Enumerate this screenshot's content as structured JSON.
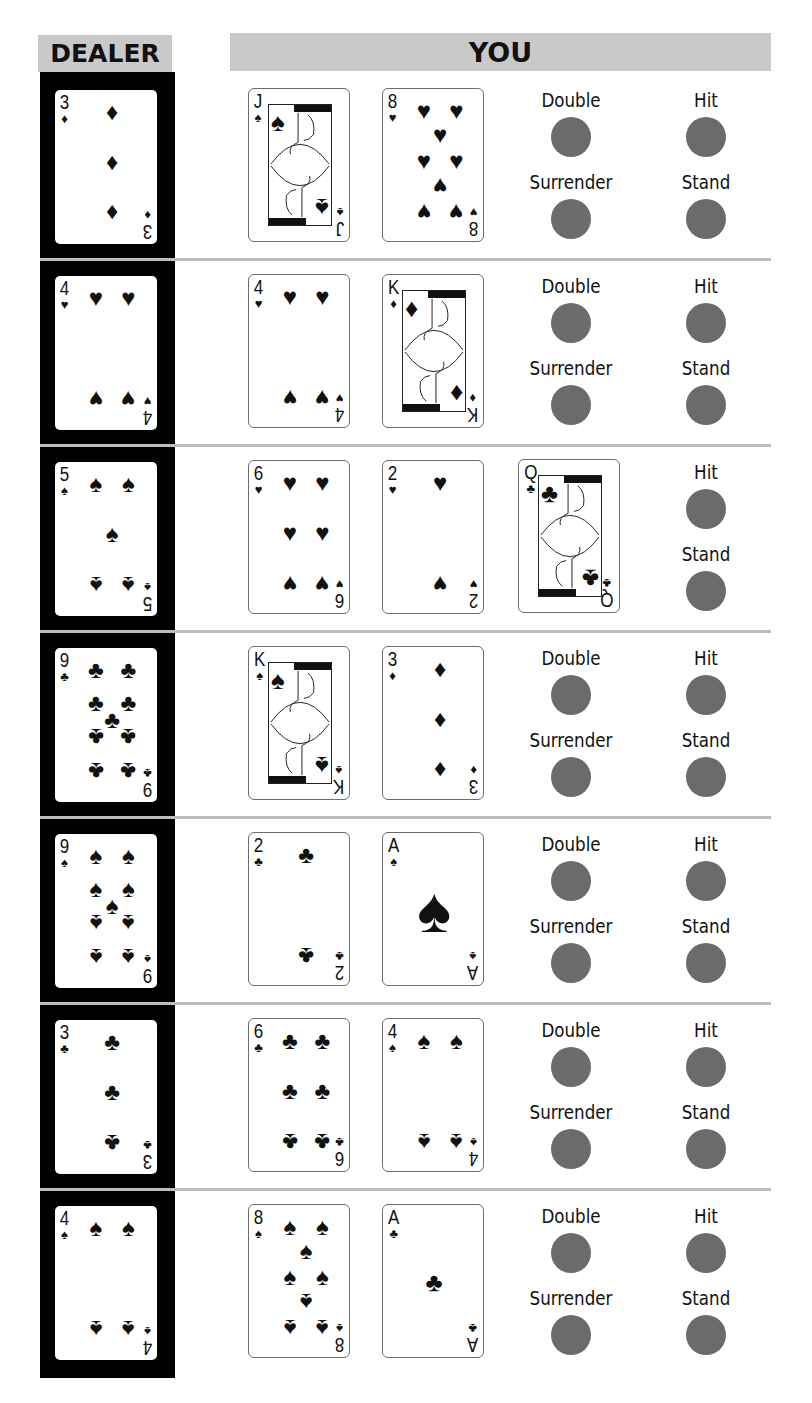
{
  "header": {
    "dealer": "DEALER",
    "you": "YOU"
  },
  "colors": {
    "header_bg": "#c9c9c9",
    "dealer_column": "#000000",
    "action_circle": "#6b6b6b",
    "divider": "#bdbdbd"
  },
  "suits": {
    "spades": "♠",
    "hearts": "♥",
    "diamonds": "♦",
    "clubs": "♣"
  },
  "rows": [
    {
      "dealer": {
        "rank": "3",
        "suit": "diamonds"
      },
      "player": [
        {
          "rank": "J",
          "suit": "spades"
        },
        {
          "rank": "8",
          "suit": "hearts"
        }
      ],
      "actions": [
        {
          "id": "double",
          "label": "Double"
        },
        {
          "id": "hit",
          "label": "Hit"
        },
        {
          "id": "surrender",
          "label": "Surrender"
        },
        {
          "id": "stand",
          "label": "Stand"
        }
      ]
    },
    {
      "dealer": {
        "rank": "4",
        "suit": "hearts"
      },
      "player": [
        {
          "rank": "4",
          "suit": "hearts"
        },
        {
          "rank": "K",
          "suit": "diamonds"
        }
      ],
      "actions": [
        {
          "id": "double",
          "label": "Double"
        },
        {
          "id": "hit",
          "label": "Hit"
        },
        {
          "id": "surrender",
          "label": "Surrender"
        },
        {
          "id": "stand",
          "label": "Stand"
        }
      ]
    },
    {
      "dealer": {
        "rank": "5",
        "suit": "spades"
      },
      "player": [
        {
          "rank": "6",
          "suit": "hearts"
        },
        {
          "rank": "2",
          "suit": "hearts"
        },
        {
          "rank": "Q",
          "suit": "clubs"
        }
      ],
      "actions": [
        {
          "id": "hit",
          "label": "Hit"
        },
        {
          "id": "stand",
          "label": "Stand"
        }
      ]
    },
    {
      "dealer": {
        "rank": "9",
        "suit": "clubs"
      },
      "player": [
        {
          "rank": "K",
          "suit": "spades"
        },
        {
          "rank": "3",
          "suit": "diamonds"
        }
      ],
      "actions": [
        {
          "id": "double",
          "label": "Double"
        },
        {
          "id": "hit",
          "label": "Hit"
        },
        {
          "id": "surrender",
          "label": "Surrender"
        },
        {
          "id": "stand",
          "label": "Stand"
        }
      ]
    },
    {
      "dealer": {
        "rank": "9",
        "suit": "spades"
      },
      "player": [
        {
          "rank": "2",
          "suit": "clubs"
        },
        {
          "rank": "A",
          "suit": "spades"
        }
      ],
      "actions": [
        {
          "id": "double",
          "label": "Double"
        },
        {
          "id": "hit",
          "label": "Hit"
        },
        {
          "id": "surrender",
          "label": "Surrender"
        },
        {
          "id": "stand",
          "label": "Stand"
        }
      ]
    },
    {
      "dealer": {
        "rank": "3",
        "suit": "clubs"
      },
      "player": [
        {
          "rank": "6",
          "suit": "clubs"
        },
        {
          "rank": "4",
          "suit": "spades"
        }
      ],
      "actions": [
        {
          "id": "double",
          "label": "Double"
        },
        {
          "id": "hit",
          "label": "Hit"
        },
        {
          "id": "surrender",
          "label": "Surrender"
        },
        {
          "id": "stand",
          "label": "Stand"
        }
      ]
    },
    {
      "dealer": {
        "rank": "4",
        "suit": "spades"
      },
      "player": [
        {
          "rank": "8",
          "suit": "spades"
        },
        {
          "rank": "A",
          "suit": "clubs"
        }
      ],
      "actions": [
        {
          "id": "double",
          "label": "Double"
        },
        {
          "id": "hit",
          "label": "Hit"
        },
        {
          "id": "surrender",
          "label": "Surrender"
        },
        {
          "id": "stand",
          "label": "Stand"
        }
      ]
    }
  ]
}
